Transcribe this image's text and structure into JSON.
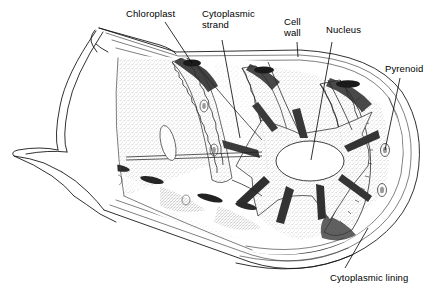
{
  "figure": {
    "background_color": "#ffffff",
    "ink_color": "#000000",
    "width": 437,
    "height": 292
  },
  "labels": {
    "chloroplast": "Chloroplast",
    "cytoplasmic_strand_line1": "Cytoplasmic",
    "cytoplasmic_strand_line2": "strand",
    "cell_wall_line1": "Cell",
    "cell_wall_line2": "wall",
    "nucleus": "Nucleus",
    "pyrenoid": "Pyrenoid",
    "cytoplasmic_lining": "Cytoplasmic lining"
  },
  "structures": {
    "cell_wall": "cell-wall",
    "cytoplasmic_lining": "cytoplasmic-lining",
    "chloroplast_ribbon": "helical-chloroplast-ribbon",
    "pyrenoid": "pyrenoid-granule",
    "nucleus": "central-nucleus",
    "cytoplasmic_strand": "cytoplasmic-strand"
  }
}
